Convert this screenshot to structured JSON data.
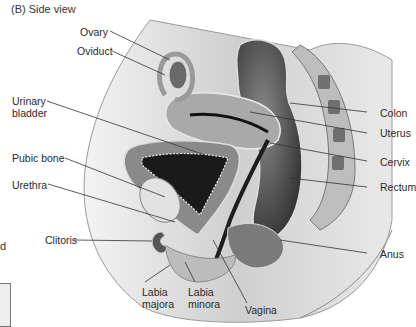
{
  "figure": {
    "panel_title": "(B)  Side view",
    "left_fragment_text": "d"
  },
  "labels": {
    "ovary": "Ovary",
    "oviduct": "Oviduct",
    "urinary_bladder_1": "Urinary",
    "urinary_bladder_2": "bladder",
    "pubic_bone": "Pubic bone",
    "urethra": "Urethra",
    "clitoris": "Clitoris",
    "labia_majora_1": "Labia",
    "labia_majora_2": "majora",
    "labia_minora_1": "Labia",
    "labia_minora_2": "minora",
    "vagina": "Vagina",
    "colon": "Colon",
    "uterus": "Uterus",
    "cervix": "Cervix",
    "rectum": "Rectum",
    "anus": "Anus"
  },
  "colors": {
    "background": "#ffffff",
    "skin": "#d6d6d6",
    "tissue_dark": "#3a3a3a",
    "leader_line": "#333333"
  }
}
